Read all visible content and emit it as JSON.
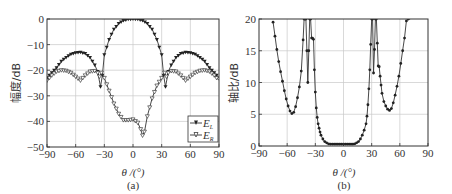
{
  "chart_data": [
    {
      "panel": "(a)",
      "type": "line",
      "title": "",
      "xlabel": "θ /(°)",
      "ylabel": "幅度/dB",
      "xlim": [
        -90,
        90
      ],
      "ylim": [
        -50,
        0
      ],
      "xticks": [
        -90,
        -60,
        -30,
        0,
        30,
        60,
        90
      ],
      "yticks": [
        0,
        -10,
        -20,
        -30,
        -40,
        -50
      ],
      "xtick_labels": [
        "−90",
        "−60",
        "−30",
        "0",
        "30",
        "60",
        "90"
      ],
      "ytick_labels": [
        "0",
        "−10",
        "−20",
        "−30",
        "−40",
        "−50"
      ],
      "grid": true,
      "legend_position": "lower right",
      "series": [
        {
          "name": "E_L",
          "marker": "filled-triangle",
          "x": [
            -90,
            -85,
            -80,
            -75,
            -70,
            -65,
            -60,
            -55,
            -50,
            -45,
            -40,
            -37,
            -34,
            -32,
            -30,
            -25,
            -20,
            -15,
            -10,
            -5,
            0,
            5,
            10,
            15,
            20,
            25,
            30,
            32,
            34,
            37,
            40,
            45,
            50,
            55,
            60,
            65,
            70,
            75,
            80,
            85,
            90
          ],
          "y": [
            -23,
            -21,
            -19,
            -16.5,
            -15,
            -13.8,
            -13.2,
            -13,
            -13.5,
            -15,
            -18,
            -20.5,
            -26.5,
            -22,
            -14,
            -8,
            -4,
            -1.8,
            -0.6,
            -0.1,
            0,
            -0.1,
            -0.6,
            -1.8,
            -4,
            -8,
            -14,
            -22,
            -26.5,
            -20.5,
            -18,
            -15,
            -13.5,
            -13,
            -13.2,
            -13.8,
            -15,
            -16.5,
            -19,
            -21,
            -23
          ]
        },
        {
          "name": "E_R",
          "marker": "open-triangle",
          "x": [
            -90,
            -85,
            -80,
            -75,
            -70,
            -65,
            -60,
            -55,
            -50,
            -45,
            -40,
            -37,
            -35,
            -33,
            -30,
            -25,
            -20,
            -15,
            -10,
            -5,
            0,
            5,
            8,
            10,
            12,
            15,
            20,
            25,
            30,
            33,
            35,
            37,
            40,
            45,
            50,
            55,
            60,
            65,
            70,
            75,
            80,
            85,
            90
          ],
          "y": [
            -24,
            -22,
            -20.5,
            -20,
            -20.2,
            -21,
            -22.5,
            -24,
            -22,
            -20.5,
            -20.3,
            -21,
            -22.5,
            -21,
            -23,
            -28,
            -33,
            -37,
            -39.5,
            -39.5,
            -39.2,
            -40.5,
            -43,
            -45.5,
            -44,
            -38,
            -31,
            -26,
            -23,
            -21,
            -22.5,
            -21,
            -20.3,
            -20.5,
            -22,
            -24,
            -22.5,
            -21,
            -20.2,
            -20,
            -20.5,
            -22,
            -24
          ]
        }
      ],
      "legend": [
        "E_L",
        "E_R"
      ]
    },
    {
      "panel": "(b)",
      "type": "line",
      "title": "",
      "xlabel": "θ /(°)",
      "ylabel": "轴比/dB",
      "xlim": [
        -90,
        90
      ],
      "ylim": [
        0,
        20
      ],
      "xticks": [
        -90,
        -60,
        -30,
        0,
        30,
        60,
        90
      ],
      "yticks": [
        0,
        5,
        10,
        15,
        20
      ],
      "xtick_labels": [
        "−90",
        "−60",
        "−30",
        "0",
        "30",
        "60",
        "90"
      ],
      "ytick_labels": [
        "0",
        "5",
        "10",
        "15",
        "20"
      ],
      "grid": true,
      "series": [
        {
          "name": "Axial ratio",
          "marker": "filled-circle",
          "x": [
            -75,
            -73,
            -71,
            -69,
            -67,
            -65,
            -63,
            -61,
            -59,
            -57,
            -55,
            -53,
            -51,
            -49,
            -47,
            -45,
            -43,
            -42,
            -41,
            -40,
            -39,
            -38,
            -37,
            -36,
            -35,
            -34,
            -33,
            -32,
            -31,
            -30,
            -29,
            -28,
            -27,
            -26,
            -25,
            -24,
            -22,
            -20,
            -18,
            -16,
            -14,
            -12,
            -10,
            -8,
            -6,
            -4,
            -2,
            0,
            2,
            4,
            6,
            8,
            10,
            12,
            14,
            16,
            18,
            20,
            22,
            24,
            25,
            26,
            27,
            28,
            29,
            30,
            31,
            32,
            33,
            34,
            35,
            36,
            37,
            38,
            39,
            40,
            41,
            43,
            45,
            47,
            49,
            51,
            53,
            55,
            57,
            59,
            61,
            63,
            65,
            67,
            69,
            71,
            73
          ],
          "y": [
            19.5,
            17.3,
            15.2,
            13.3,
            11.7,
            10.2,
            8.7,
            7.4,
            6.3,
            5.5,
            5.1,
            5.3,
            6.2,
            7.6,
            9.3,
            11.8,
            16.7,
            20,
            20,
            20,
            15,
            10,
            15,
            20,
            20,
            17,
            17,
            16.8,
            12,
            8.5,
            6,
            4.5,
            3.5,
            2.8,
            2.2,
            1.7,
            1.1,
            0.7,
            0.5,
            0.35,
            0.3,
            0.3,
            0.3,
            0.3,
            0.3,
            0.3,
            0.3,
            0.3,
            0.3,
            0.3,
            0.3,
            0.3,
            0.3,
            0.35,
            0.5,
            0.7,
            1.1,
            1.7,
            2.5,
            3.5,
            4.7,
            6.5,
            9,
            12,
            16,
            20,
            20,
            11.5,
            15.2,
            20,
            20,
            16.2,
            12.6,
            12.5,
            11,
            9.6,
            8.3,
            7,
            6.3,
            5.8,
            5.6,
            5.9,
            6.8,
            8,
            9.4,
            11,
            13,
            15,
            17,
            19.7,
            20,
            20
          ]
        }
      ]
    }
  ]
}
